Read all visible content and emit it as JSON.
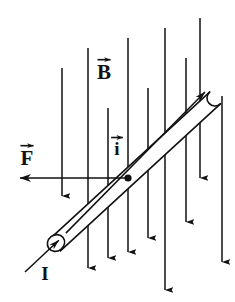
{
  "figure": {
    "type": "physics-vector-diagram",
    "width": 235,
    "height": 302,
    "background_color": "#ffffff",
    "stroke_color": "#111111"
  },
  "labels": {
    "magnetic_field": {
      "text": "B",
      "name": "magnetic-field-label",
      "has_vector_arrow": true,
      "x": 104,
      "y": 79,
      "font_size": 21
    },
    "current_vector": {
      "text": "i",
      "name": "current-vector-label",
      "has_vector_arrow": true,
      "x": 117,
      "y": 155,
      "font_size": 19
    },
    "force": {
      "text": "F",
      "name": "force-label",
      "has_vector_arrow": true,
      "x": 27,
      "y": 165,
      "font_size": 21
    },
    "current_scalar": {
      "text": "I",
      "name": "current-label",
      "has_vector_arrow": false,
      "x": 45,
      "y": 280,
      "font_size": 19
    }
  },
  "rod": {
    "name": "conducting-rod",
    "description": "cylindrical tube drawn as two parallel lines with rounded cap at upper-right and open elliptical mouth at lower-left",
    "angle_degrees": -38,
    "lower_left": {
      "x": 55,
      "y": 245
    },
    "upper_right": {
      "x": 215,
      "y": 98
    },
    "thickness": 16,
    "open_end_ellipse": {
      "cx": 56,
      "cy": 243,
      "rx": 9,
      "ry": 8
    }
  },
  "current_axis_arrow": {
    "name": "current-direction-arrow",
    "from": {
      "x": 25,
      "y": 272
    },
    "to": {
      "x": 205,
      "y": 92
    },
    "direction": "up-right along rod axis",
    "arrowheads": [
      "at lower-left over tube mouth",
      "at upper-right beyond rod cap"
    ]
  },
  "force_arrow": {
    "name": "force-arrow",
    "from": {
      "x": 128,
      "y": 178
    },
    "to": {
      "x": 20,
      "y": 178
    },
    "direction": "left",
    "origin_dot": {
      "cx": 128,
      "cy": 178,
      "r": 3.6
    }
  },
  "field_arrows": {
    "name": "magnetic-field-arrows",
    "direction": "downward",
    "count": 9,
    "arrows": [
      {
        "x": 62,
        "y1": 68,
        "y2": 196
      },
      {
        "x": 88,
        "y1": 48,
        "y2": 268
      },
      {
        "x": 108,
        "y1": 108,
        "y2": 258
      },
      {
        "x": 128,
        "y1": 38,
        "y2": 252
      },
      {
        "x": 148,
        "y1": 88,
        "y2": 238
      },
      {
        "x": 165,
        "y1": 28,
        "y2": 290
      },
      {
        "x": 186,
        "y1": 58,
        "y2": 222
      },
      {
        "x": 200,
        "y1": 18,
        "y2": 178
      },
      {
        "x": 222,
        "y1": 96,
        "y2": 262
      }
    ]
  }
}
